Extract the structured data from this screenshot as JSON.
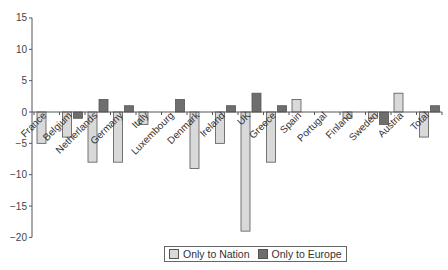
{
  "chart_data": {
    "type": "bar",
    "title": "",
    "xlabel": "",
    "ylabel": "",
    "ylim": [
      -20,
      15
    ],
    "yticks": [
      15,
      10,
      5,
      0,
      -5,
      -10,
      -15,
      -20
    ],
    "grid": false,
    "legend_position": "bottom",
    "categories": [
      "France",
      "Belgium",
      "Netherlands",
      "Germany",
      "Italy",
      "Luxembourg",
      "Denmark",
      "Ireland",
      "UK",
      "Greece",
      "Spain",
      "Portugal",
      "Finland",
      "Sweden",
      "Austria",
      "Total"
    ],
    "series": [
      {
        "name": "Only to Nation",
        "color": "#d9d9d9",
        "values": [
          -5,
          -4,
          -8,
          -8,
          -2,
          0,
          -9,
          -5,
          -19,
          -8,
          2,
          0,
          -1,
          -1,
          3,
          -4
        ]
      },
      {
        "name": "Only to Europe",
        "color": "#6e6e6e",
        "values": [
          0,
          -1,
          2,
          1,
          0,
          2,
          0,
          1,
          3,
          1,
          0,
          0,
          0,
          -2,
          0,
          1
        ]
      }
    ]
  },
  "legend": {
    "nation_label": "Only to Nation",
    "europe_label": "Only to Europe"
  }
}
